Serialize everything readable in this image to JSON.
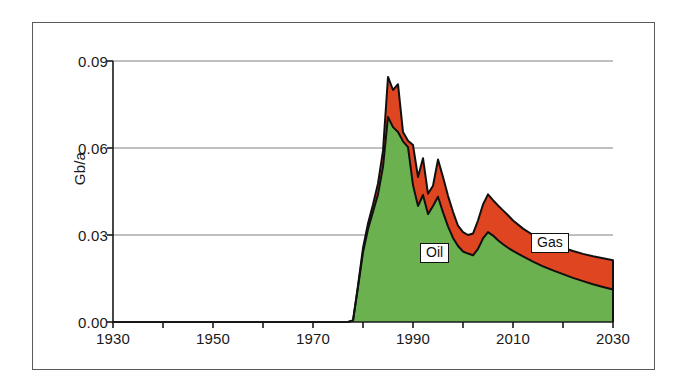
{
  "figure": {
    "background_color": "#ffffff",
    "frame_color": "#5a5a5a"
  },
  "chart_data": {
    "type": "area",
    "title": "",
    "subtitle": "",
    "xlabel": "",
    "ylabel": "Gb/a",
    "xlim": [
      1930,
      2030
    ],
    "ylim": [
      0.0,
      0.09
    ],
    "grid": "horizontal",
    "stacked": true,
    "legend_position": "inline-annotations",
    "xticks": [
      1930,
      1950,
      1970,
      1990,
      2010,
      2030
    ],
    "xtick_labels": [
      "1930",
      "1950",
      "1970",
      "1990",
      "2010",
      "2030"
    ],
    "yticks": [
      0.0,
      0.03,
      0.06,
      0.09
    ],
    "ytick_labels": [
      "0.00",
      "0.03",
      "0.06",
      "0.09"
    ],
    "colors": {
      "oil": "#6CB14F",
      "gas": "#E04522",
      "outline": "#101010",
      "gridline": "#808080",
      "axis": "#1a1a1a"
    },
    "annotations": [
      {
        "text": "Oil",
        "x": 1992,
        "y": 0.0215,
        "boxed": true
      },
      {
        "text": "Gas",
        "x": 2014,
        "y": 0.026,
        "boxed": true
      }
    ],
    "series": [
      {
        "name": "Oil",
        "color": "#6CB14F",
        "x": [
          1930,
          1975,
          1977,
          1978,
          1979,
          1980,
          1981,
          1982,
          1983,
          1984,
          1985,
          1986,
          1987,
          1988,
          1989,
          1990,
          1991,
          1992,
          1993,
          1994,
          1995,
          1996,
          1997,
          1998,
          1999,
          2000,
          2001,
          2002,
          2003,
          2004,
          2005,
          2006,
          2007,
          2008,
          2009,
          2010,
          2012,
          2014,
          2016,
          2018,
          2020,
          2022,
          2024,
          2026,
          2028,
          2030
        ],
        "values": [
          0.0,
          0.0,
          0.0,
          0.0005,
          0.012,
          0.024,
          0.032,
          0.038,
          0.044,
          0.0535,
          0.0707,
          0.0672,
          0.0655,
          0.0623,
          0.0603,
          0.0472,
          0.04,
          0.0438,
          0.0372,
          0.04,
          0.0432,
          0.0378,
          0.033,
          0.029,
          0.0262,
          0.0243,
          0.0236,
          0.023,
          0.0252,
          0.0288,
          0.031,
          0.0298,
          0.0282,
          0.0268,
          0.0256,
          0.0245,
          0.0226,
          0.0208,
          0.0192,
          0.0178,
          0.0165,
          0.0152,
          0.0141,
          0.013,
          0.0121,
          0.0112
        ]
      },
      {
        "name": "Gas",
        "color": "#E04522",
        "x": [
          1930,
          1975,
          1977,
          1978,
          1979,
          1980,
          1981,
          1982,
          1983,
          1984,
          1985,
          1986,
          1987,
          1988,
          1989,
          1990,
          1991,
          1992,
          1993,
          1994,
          1995,
          1996,
          1997,
          1998,
          1999,
          2000,
          2001,
          2002,
          2003,
          2004,
          2005,
          2006,
          2007,
          2008,
          2009,
          2010,
          2012,
          2014,
          2016,
          2018,
          2020,
          2022,
          2024,
          2026,
          2028,
          2030
        ],
        "values": [
          0.0,
          0.0,
          0.0,
          0.0005,
          0.0125,
          0.0255,
          0.034,
          0.0405,
          0.0478,
          0.059,
          0.0845,
          0.08,
          0.082,
          0.0655,
          0.0625,
          0.061,
          0.05,
          0.0565,
          0.0442,
          0.047,
          0.056,
          0.05,
          0.0435,
          0.038,
          0.0332,
          0.031,
          0.03,
          0.0305,
          0.035,
          0.0405,
          0.044,
          0.042,
          0.0402,
          0.0385,
          0.0368,
          0.035,
          0.0322,
          0.03,
          0.0282,
          0.0268,
          0.0256,
          0.0245,
          0.0235,
          0.0227,
          0.022,
          0.0213
        ]
      }
    ],
    "totals_note": "Gas series values are cumulative tops of the stacked area (oil + gas)."
  },
  "axes": {
    "y_axis_title": "Gb/a",
    "y_ticks": [
      "0.09",
      "0.06",
      "0.03",
      "0.00"
    ],
    "x_ticks": [
      "1930",
      "1950",
      "1970",
      "1990",
      "2010",
      "2030"
    ]
  },
  "labels": {
    "oil": "Oil",
    "gas": "Gas"
  }
}
